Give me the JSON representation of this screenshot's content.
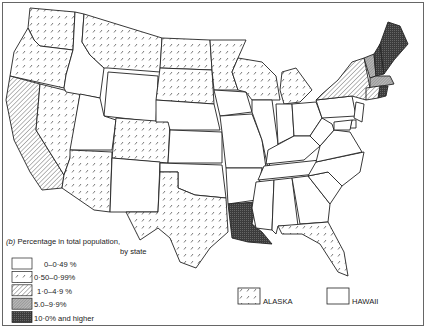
{
  "figure": {
    "panel_label": "(b)",
    "title": "Percentage in total population,",
    "subtitle": "by state"
  },
  "colors": {
    "stroke": "#222222",
    "background": "#ffffff",
    "dark_fill": "#444444"
  },
  "legend": {
    "classes": [
      {
        "id": "c0",
        "label": "0–0·49 %",
        "pattern": "blank"
      },
      {
        "id": "c1",
        "label": "0·50–0·99%",
        "pattern": "sparse-dash"
      },
      {
        "id": "c2",
        "label": "1·0–4·9 %",
        "pattern": "diagonal-hatch"
      },
      {
        "id": "c3",
        "label": "5.0–9·9%",
        "pattern": "fine-hatch-grey"
      },
      {
        "id": "c4",
        "label": "10·0% and higher",
        "pattern": "dark-crosshatch"
      }
    ]
  },
  "insets": {
    "alaska": {
      "label": "ALASKA",
      "class": "c1"
    },
    "hawaii": {
      "label": "HAWAII",
      "class": "c0"
    }
  },
  "chart_data": {
    "type": "choropleth",
    "title": "(b) Percentage in total population, by state",
    "classes": [
      "0–0·49 %",
      "0·50–0·99%",
      "1·0–4·9 %",
      "5.0–9·9%",
      "10·0% and higher"
    ],
    "states": {
      "Washington": "0·50–0·99%",
      "Oregon": "0·50–0·99%",
      "California": "1·0–4·9 %",
      "Nevada": "0·50–0·99%",
      "Idaho": "0–0·49 %",
      "Montana": "0·50–0·99%",
      "Wyoming": "0–0·49 %",
      "Utah": "0–0·49 %",
      "Colorado": "0·50–0·99%",
      "Arizona": "0·50–0·99%",
      "New Mexico": "0–0·49 %",
      "North Dakota": "0·50–0·99%",
      "South Dakota": "0·50–0·99%",
      "Nebraska": "0–0·49 %",
      "Kansas": "0–0·49 %",
      "Oklahoma": "0–0·49 %",
      "Texas": "0·50–0·99%",
      "Minnesota": "0·50–0·99%",
      "Iowa": "0–0·49 %",
      "Missouri": "0–0·49 %",
      "Arkansas": "0–0·49 %",
      "Louisiana": "10·0% and higher",
      "Wisconsin": "0·50–0·99%",
      "Michigan": "0·50–0·99%",
      "Illinois": "0–0·49 %",
      "Indiana": "0–0·49 %",
      "Ohio": "0–0·49 %",
      "Kentucky": "0–0·49 %",
      "Tennessee": "0–0·49 %",
      "Mississippi": "0–0·49 %",
      "Alabama": "0–0·49 %",
      "Georgia": "0–0·49 %",
      "Florida": "0·50–0·99%",
      "South Carolina": "0–0·49 %",
      "North Carolina": "0–0·49 %",
      "Virginia": "0–0·49 %",
      "West Virginia": "0–0·49 %",
      "Pennsylvania": "0–0·49 %",
      "New York": "1·0–4·9 %",
      "Vermont": "5.0–9·9%",
      "New Hampshire": "10·0% and higher",
      "Maine": "10·0% and higher",
      "Massachusetts": "5.0–9·9%",
      "Rhode Island": "10·0% and higher",
      "Connecticut": "1·0–4·9 %",
      "New Jersey": "0–0·49 %",
      "Delaware": "0–0·49 %",
      "Maryland": "0–0·49 %",
      "Alaska": "0·50–0·99%",
      "Hawaii": "0–0·49 %"
    },
    "legend_position": "bottom-left"
  }
}
